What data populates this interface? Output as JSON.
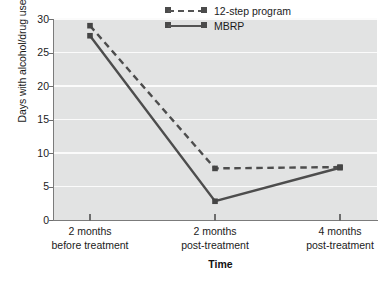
{
  "chart_data": {
    "type": "line",
    "title": "",
    "xlabel": "Time",
    "ylabel": "Days with alcohol/drug use",
    "categories": [
      "2 months before treatment",
      "2 months post-treatment",
      "4 months post-treatment"
    ],
    "category_lines": [
      [
        "2 months",
        "before treatment"
      ],
      [
        "2 months",
        "post-treatment"
      ],
      [
        "4 months",
        "post-treatment"
      ]
    ],
    "series": [
      {
        "name": "12-step program",
        "style": "dashed",
        "values": [
          29.0,
          7.7,
          7.9
        ]
      },
      {
        "name": "MBRP",
        "style": "solid",
        "values": [
          27.5,
          2.8,
          7.8
        ]
      }
    ],
    "ylim": [
      0,
      30
    ],
    "yticks": [
      0,
      5,
      10,
      15,
      20,
      25,
      30
    ],
    "ytick_labels": [
      "0",
      "5",
      "10",
      "15",
      "20",
      "25",
      "30"
    ],
    "grid": true,
    "grid_axis": "y",
    "legend_position": "top-right",
    "colors": {
      "line": "#4d4d4d",
      "marker": "#454545",
      "plot_background": "#e2e3e3",
      "gridline": "#fbfbfb",
      "axis": "#7b7b7b",
      "text": "#1b1b1b",
      "page_background": "#ffffff"
    }
  },
  "legend": {
    "items": [
      {
        "label": "12-step program",
        "style": "dashed"
      },
      {
        "label": "MBRP",
        "style": "solid"
      }
    ]
  },
  "axes": {
    "y_title": "Days with alcohol/drug use",
    "x_title": "Time",
    "y_tick_labels": [
      "30",
      "25",
      "20",
      "15",
      "10",
      "5",
      "0"
    ]
  }
}
